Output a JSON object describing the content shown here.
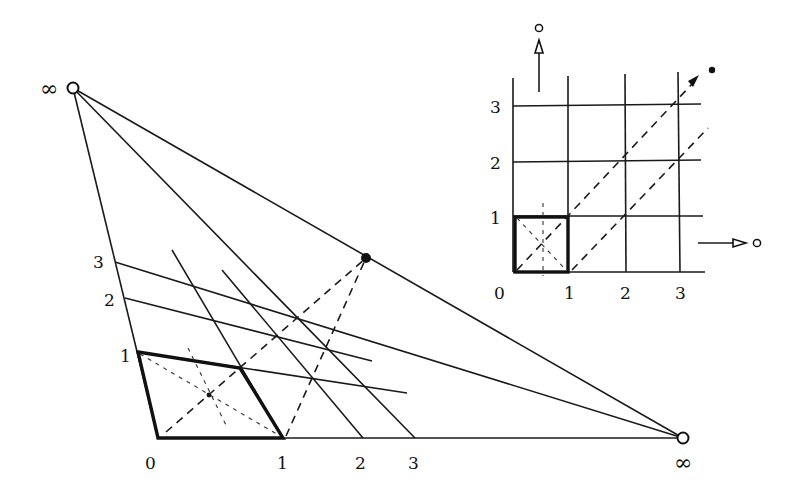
{
  "figure": {
    "main": {
      "infinity_top_label": "∞",
      "infinity_bottom_label": "∞",
      "bottom_axis_labels": [
        "0",
        "1",
        "2",
        "3"
      ],
      "left_axis_labels": [
        "1",
        "2",
        "3"
      ]
    },
    "inset": {
      "bottom_axis_labels": [
        "0",
        "1",
        "2",
        "3"
      ],
      "left_axis_labels": [
        "1",
        "2",
        "3"
      ],
      "up_arrow_target": "o",
      "right_arrow_target": "o"
    }
  }
}
